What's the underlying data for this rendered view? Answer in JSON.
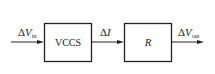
{
  "diagram": {
    "blocks": [
      {
        "id": "vccs",
        "label": "VCCS"
      },
      {
        "id": "r",
        "label": "R"
      }
    ],
    "signals": {
      "input": {
        "delta": "Δ",
        "symbol": "V",
        "subscript": "in"
      },
      "middle": {
        "delta": "Δ",
        "symbol": "I"
      },
      "output": {
        "delta": "Δ",
        "symbol": "V",
        "subscript": "out"
      }
    },
    "colors": {
      "stroke": "#222222",
      "background": "#ffffff"
    }
  }
}
